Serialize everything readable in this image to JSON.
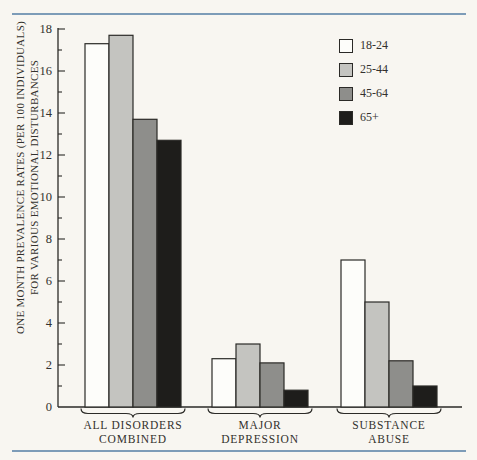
{
  "page": {
    "background": "#f8f6f1",
    "rule_color": "#7d9cb8",
    "ink": "#2b2a27",
    "text_color": "#33312d"
  },
  "chart_data": {
    "type": "bar",
    "ylabel_line1": "ONE MONTH PREVALENCE RATES (PER 100 INDIVIDUALS)",
    "ylabel_line2": "FOR VARIOUS EMOTIONAL DISTURBANCES",
    "categories": [
      {
        "lines": [
          "ALL DISORDERS",
          "COMBINED"
        ]
      },
      {
        "lines": [
          "MAJOR",
          "DEPRESSION"
        ]
      },
      {
        "lines": [
          "SUBSTANCE",
          "ABUSE"
        ]
      }
    ],
    "series": [
      {
        "name": "18-24",
        "color": "#fdfdfa",
        "values": [
          17.3,
          2.3,
          7.0
        ]
      },
      {
        "name": "25-44",
        "color": "#c4c4c0",
        "values": [
          17.7,
          3.0,
          5.0
        ]
      },
      {
        "name": "45-64",
        "color": "#8e8e8b",
        "values": [
          13.7,
          2.1,
          2.2
        ]
      },
      {
        "name": "65+",
        "color": "#1e1d1b",
        "values": [
          12.7,
          0.8,
          1.0
        ]
      }
    ],
    "ylim": [
      0,
      18
    ],
    "yticks": [
      0,
      2,
      4,
      6,
      8,
      10,
      12,
      14,
      16,
      18
    ],
    "minor_ticks_every": 1,
    "grid": false,
    "legend_position": "upper right"
  }
}
